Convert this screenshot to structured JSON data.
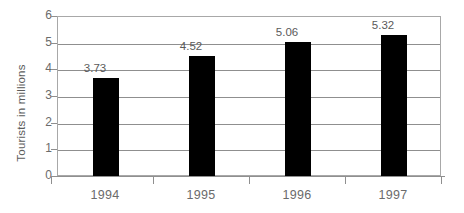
{
  "chart_data": {
    "type": "bar",
    "title": "",
    "subtitle": "",
    "xlabel": "",
    "ylabel": "Tourists in millions",
    "categories": [
      "1994",
      "1995",
      "1996",
      "1997"
    ],
    "values": [
      3.73,
      4.52,
      5.06,
      5.32
    ],
    "value_labels": [
      "3.73",
      "4.52",
      "5.06",
      "5.32"
    ],
    "ylim": [
      0,
      6
    ],
    "y_ticks": [
      "0",
      "1",
      "2",
      "3",
      "4",
      "5",
      "6"
    ],
    "grid": true,
    "legend": "none",
    "bar_color": "#000000",
    "axis_color": "#8f8f8f",
    "text_color": "#5c5c5c",
    "background_color": "#ffffff"
  }
}
